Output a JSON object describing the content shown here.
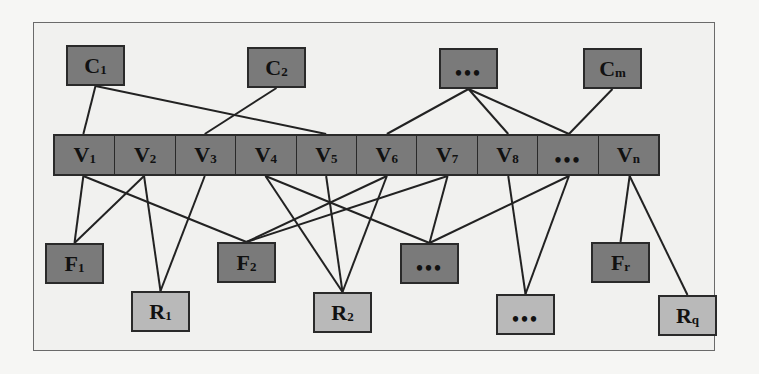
{
  "diagram": {
    "type": "bipartite-layered-graph",
    "top_layer": {
      "name": "C",
      "fill": "#7a7a7a",
      "nodes": [
        {
          "id": "C1",
          "base": "C",
          "sub": "1",
          "x": 66,
          "y": 45
        },
        {
          "id": "C2",
          "base": "C",
          "sub": "2",
          "x": 247,
          "y": 47
        },
        {
          "id": "Cdots",
          "base": "...",
          "sub": "",
          "x": 439,
          "y": 48
        },
        {
          "id": "Cm",
          "base": "C",
          "sub": "m",
          "x": 583,
          "y": 48
        }
      ]
    },
    "middle_layer": {
      "name": "V",
      "fill": "#7a7a7a",
      "cells": [
        {
          "id": "V1",
          "base": "V",
          "sub": "1"
        },
        {
          "id": "V2",
          "base": "V",
          "sub": "2"
        },
        {
          "id": "V3",
          "base": "V",
          "sub": "3"
        },
        {
          "id": "V4",
          "base": "V",
          "sub": "4"
        },
        {
          "id": "V5",
          "base": "V",
          "sub": "5"
        },
        {
          "id": "V6",
          "base": "V",
          "sub": "6"
        },
        {
          "id": "V7",
          "base": "V",
          "sub": "7"
        },
        {
          "id": "V8",
          "base": "V",
          "sub": "8"
        },
        {
          "id": "Vdots",
          "base": "...",
          "sub": ""
        },
        {
          "id": "Vn",
          "base": "V",
          "sub": "n"
        }
      ]
    },
    "f_layer": {
      "name": "F",
      "fill": "#7a7a7a",
      "nodes": [
        {
          "id": "F1",
          "base": "F",
          "sub": "1",
          "x": 45,
          "y": 243
        },
        {
          "id": "F2",
          "base": "F",
          "sub": "2",
          "x": 217,
          "y": 242
        },
        {
          "id": "Fdots",
          "base": "...",
          "sub": "",
          "x": 400,
          "y": 243
        },
        {
          "id": "Fr",
          "base": "F",
          "sub": "r",
          "x": 591,
          "y": 242
        }
      ]
    },
    "r_layer": {
      "name": "R",
      "fill": "#b9b9b9",
      "nodes": [
        {
          "id": "R1",
          "base": "R",
          "sub": "1",
          "x": 131,
          "y": 291
        },
        {
          "id": "R2",
          "base": "R",
          "sub": "2",
          "x": 313,
          "y": 292
        },
        {
          "id": "Rdots",
          "base": "...",
          "sub": "",
          "x": 496,
          "y": 294
        },
        {
          "id": "Rq",
          "base": "R",
          "sub": "q",
          "x": 658,
          "y": 295
        }
      ]
    },
    "edges": [
      [
        "C1",
        "V1"
      ],
      [
        "C1",
        "V5"
      ],
      [
        "C2",
        "V3"
      ],
      [
        "Cdots",
        "V6"
      ],
      [
        "Cdots",
        "V8"
      ],
      [
        "Cdots",
        "Vdots"
      ],
      [
        "Cm",
        "Vdots"
      ],
      [
        "V1",
        "F1"
      ],
      [
        "V1",
        "F2"
      ],
      [
        "V2",
        "F1"
      ],
      [
        "V2",
        "R1"
      ],
      [
        "V3",
        "R1"
      ],
      [
        "V4",
        "R2"
      ],
      [
        "V4",
        "Fdots"
      ],
      [
        "V5",
        "R2"
      ],
      [
        "V6",
        "F2"
      ],
      [
        "V6",
        "R2"
      ],
      [
        "V7",
        "F2"
      ],
      [
        "V7",
        "Fdots"
      ],
      [
        "V8",
        "Rdots"
      ],
      [
        "Vdots",
        "Fdots"
      ],
      [
        "Vdots",
        "Rdots"
      ],
      [
        "Vn",
        "Fr"
      ],
      [
        "Vn",
        "Rq"
      ]
    ],
    "colors": {
      "dark_node": "#7a7a7a",
      "light_node": "#b9b9b9",
      "edge": "#222222",
      "frame_bg": "#f1f1ef"
    }
  }
}
